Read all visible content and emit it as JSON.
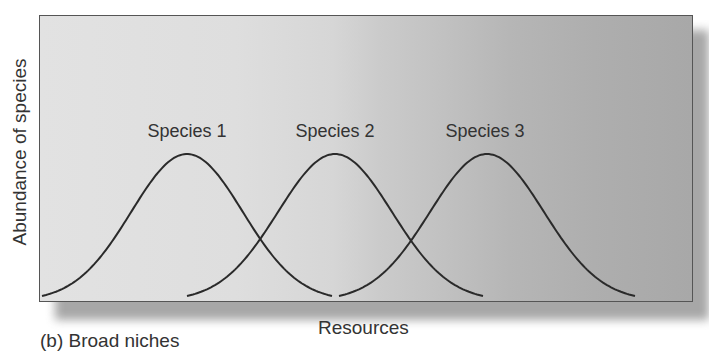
{
  "figure": {
    "caption": "(b) Broad niches",
    "xlabel": "Resources",
    "ylabel": "Abundance of species",
    "species_labels": [
      "Species 1",
      "Species 2",
      "Species 3"
    ]
  },
  "colors": {
    "curve": "#2a2a2a",
    "panel_left": "#e2e2e2",
    "panel_right": "#a8a8a8",
    "border": "#555555"
  },
  "chart_data": {
    "type": "line",
    "title": "(b) Broad niches",
    "xlabel": "Resources",
    "ylabel": "Abundance of species",
    "grid": false,
    "legend": "labels above curve peaks",
    "series": [
      {
        "name": "Species 1",
        "distribution": "gaussian",
        "center_px": 187,
        "half_width_px": 145,
        "peak": 1.0
      },
      {
        "name": "Species 2",
        "distribution": "gaussian",
        "center_px": 335,
        "half_width_px": 148,
        "peak": 1.0
      },
      {
        "name": "Species 3",
        "distribution": "gaussian",
        "center_px": 487,
        "half_width_px": 148,
        "peak": 1.0
      }
    ]
  }
}
